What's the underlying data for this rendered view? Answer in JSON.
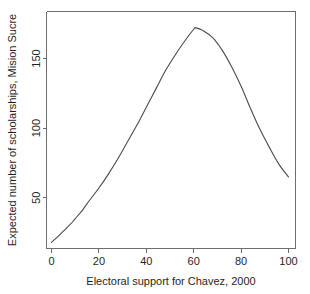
{
  "chart_data": {
    "type": "line",
    "title": "",
    "subtitle": "",
    "xlabel": "Electoral support for Chavez, 2000",
    "ylabel": "Expected number of scholarships, Mision Sucre",
    "xlim": [
      0,
      100
    ],
    "ylim": [
      15,
      178
    ],
    "xticks": [
      0,
      20,
      40,
      60,
      80,
      100
    ],
    "xtick_labels": [
      "0",
      "20",
      "40",
      "60",
      "80",
      "100"
    ],
    "yticks": [
      50,
      100,
      150
    ],
    "ytick_labels": [
      "50",
      "100",
      "150"
    ],
    "grid": false,
    "legend": false,
    "legend_position": "none",
    "series": [
      {
        "name": "Expected scholarships",
        "color": "#4a4a4a",
        "x": [
          0,
          2,
          5,
          8,
          10,
          13,
          16,
          20,
          24,
          28,
          32,
          36,
          40,
          44,
          48,
          52,
          56,
          60,
          61,
          64,
          68,
          72,
          76,
          80,
          84,
          88,
          92,
          96,
          100
        ],
        "values": [
          18,
          21,
          26,
          31,
          35,
          41,
          48,
          57,
          67,
          78,
          90,
          102,
          115,
          128,
          141,
          152,
          162,
          171,
          172,
          170,
          165,
          156,
          144,
          130,
          114,
          99,
          86,
          74,
          65
        ]
      }
    ],
    "annotations": []
  },
  "axis": {
    "x_tick_count": 6,
    "y_tick_count": 3
  }
}
